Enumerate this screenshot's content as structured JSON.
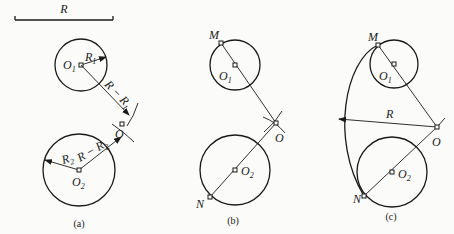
{
  "diagram": {
    "type": "geometric-construction",
    "given_length_label": "R",
    "panels": [
      {
        "caption": "(a)",
        "labels": {
          "r_bar": "R",
          "o1": "O",
          "o1_sub": "1",
          "r1": "R",
          "r1_sub": "1",
          "r_minus_r1": "R − R",
          "r_minus_r1_sub": "1",
          "o": "O",
          "r2": "R",
          "r2_sub": "2",
          "r_minus_r2": "R − R",
          "r_minus_r2_sub": "2",
          "o2": "O",
          "o2_sub": "2"
        }
      },
      {
        "caption": "(b)",
        "labels": {
          "m": "M",
          "o1": "O",
          "o1_sub": "1",
          "o": "O",
          "o2": "O",
          "o2_sub": "2",
          "n": "N"
        }
      },
      {
        "caption": "(c)",
        "labels": {
          "m": "M",
          "o1": "O",
          "o1_sub": "1",
          "r": "R",
          "o": "O",
          "o2": "O",
          "o2_sub": "2",
          "n": "N"
        }
      }
    ]
  }
}
